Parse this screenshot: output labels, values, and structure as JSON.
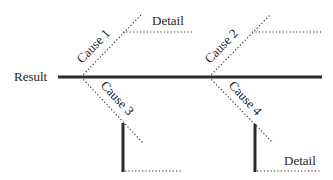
{
  "diagram": {
    "type": "fishbone",
    "result_label": "Result",
    "causes": [
      {
        "id": 1,
        "label": "Cause 1",
        "direction": "up",
        "detail_label": "Detail"
      },
      {
        "id": 2,
        "label": "Cause 2",
        "direction": "up",
        "detail_label": ""
      },
      {
        "id": 3,
        "label": "Cause 3",
        "direction": "down",
        "detail_label": ""
      },
      {
        "id": 4,
        "label": "Cause 4",
        "direction": "down",
        "detail_label": "Detail"
      }
    ],
    "colors": {
      "line": "#2b2b2b",
      "text": "#1e1e1e",
      "background": "#ffffff"
    }
  }
}
